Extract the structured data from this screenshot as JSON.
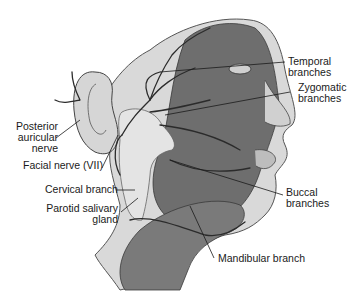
{
  "diagram": {
    "labels": {
      "temporal": [
        "Temporal",
        "branches"
      ],
      "zygomatic": [
        "Zygomatic",
        "branches"
      ],
      "posterior_auricular": [
        "Posterior",
        "auricular",
        "nerve"
      ],
      "facial_nerve": "Facial nerve (VII)",
      "cervical": "Cervical branch",
      "parotid": [
        "Parotid salivary",
        "gland"
      ],
      "buccal": [
        "Buccal",
        "branches"
      ],
      "mandibular": "Mandibular branch"
    },
    "colors": {
      "background": "#ffffff",
      "skin": "#d9d9d9",
      "muscle": "#6e6e6e",
      "muscle_dark": "#4a4a4a",
      "gland": "#e4e4e4",
      "nerve": "#2b2b2b",
      "leader": "#1a1a1a",
      "text": "#1a1a1a"
    }
  }
}
